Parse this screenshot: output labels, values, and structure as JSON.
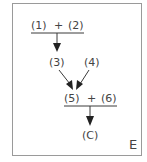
{
  "diagram": {
    "nodes": {
      "n1": "(1)",
      "plus1": "+",
      "n2": "(2)",
      "n3": "(3)",
      "n4": "(4)",
      "n5": "(5)",
      "plus2": "+",
      "n6": "(6)",
      "c": "(C)"
    },
    "corner_label": "E",
    "edges": [
      {
        "from": "(1) + (2)",
        "to": "(3)"
      },
      {
        "from": "(3)",
        "to": "(5) + (6)"
      },
      {
        "from": "(4)",
        "to": "(5) + (6)"
      },
      {
        "from": "(5) + (6)",
        "to": "(C)"
      }
    ],
    "colors": {
      "line": "#3a3a3a",
      "frame": "#9a9a9a"
    }
  }
}
